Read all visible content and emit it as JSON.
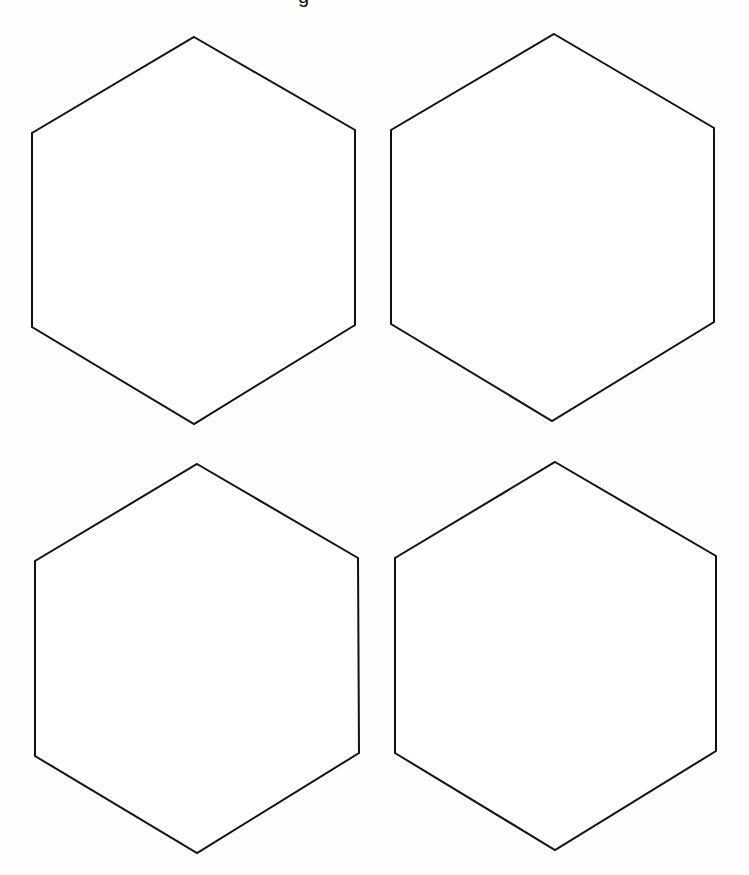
{
  "document": {
    "type": "printable-template",
    "title_fragment": "g",
    "shape": "hexagon",
    "shape_count": 4,
    "layout": "2x2 grid",
    "stroke_color": "#111111",
    "fill_color": "#ffffff",
    "background_color": "#fefefe"
  },
  "hexagons": [
    {
      "id": "top-left",
      "points": "194,37 355,130 355,325 194,424 32,327 32,133"
    },
    {
      "id": "top-right",
      "points": "554,34 714,128 714,322 552,421 391,324 391,130"
    },
    {
      "id": "bottom-left",
      "points": "197,464 358,558 359,753 197,853 35,756 35,561"
    },
    {
      "id": "bottom-right",
      "points": "555,462 716,556 716,751 555,850 395,753 395,558"
    }
  ]
}
